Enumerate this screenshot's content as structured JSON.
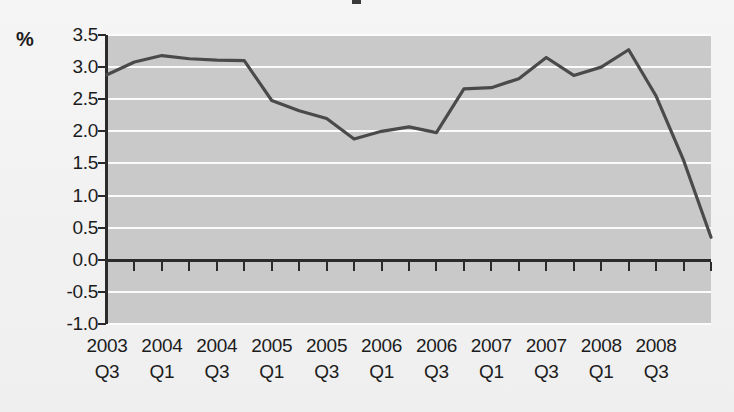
{
  "figure": {
    "axis_unit_label": "%",
    "background_color": "#c9c9c9",
    "page_color": "#f3f3f3",
    "gridline_color": "#fbfbfb",
    "axis_color": "#2b2b2b",
    "series_color": "#4a4a4a"
  },
  "chart_data": {
    "type": "line",
    "title": "",
    "subtitle": "",
    "xlabel": "",
    "ylabel": "%",
    "ylim": [
      -1.0,
      3.5
    ],
    "ytick_labels": [
      "3.5",
      "3.0",
      "2.5",
      "2.0",
      "1.5",
      "1.0",
      "0.5",
      "0.0",
      "-0.5",
      "-1.0"
    ],
    "ytick_values": [
      3.5,
      3.0,
      2.5,
      2.0,
      1.5,
      1.0,
      0.5,
      0.0,
      -0.5,
      -1.0
    ],
    "grid": true,
    "grid_axis": "y",
    "legend": "none",
    "x": [
      "2003 Q3",
      "2003 Q4",
      "2004 Q1",
      "2004 Q2",
      "2004 Q3",
      "2004 Q4",
      "2005 Q1",
      "2005 Q2",
      "2005 Q3",
      "2005 Q4",
      "2006 Q1",
      "2006 Q2",
      "2006 Q3",
      "2006 Q4",
      "2007 Q1",
      "2007 Q2",
      "2007 Q3",
      "2007 Q4",
      "2008 Q1",
      "2008 Q2",
      "2008 Q3",
      "2008 Q4",
      "2009 Q1"
    ],
    "xtick_labels": [
      {
        "index": 0,
        "year": "2003",
        "quarter": "Q3"
      },
      {
        "index": 2,
        "year": "2004",
        "quarter": "Q1"
      },
      {
        "index": 4,
        "year": "2004",
        "quarter": "Q3"
      },
      {
        "index": 6,
        "year": "2005",
        "quarter": "Q1"
      },
      {
        "index": 8,
        "year": "2005",
        "quarter": "Q3"
      },
      {
        "index": 10,
        "year": "2006",
        "quarter": "Q1"
      },
      {
        "index": 12,
        "year": "2006",
        "quarter": "Q3"
      },
      {
        "index": 14,
        "year": "2007",
        "quarter": "Q1"
      },
      {
        "index": 16,
        "year": "2007",
        "quarter": "Q3"
      },
      {
        "index": 18,
        "year": "2008",
        "quarter": "Q1"
      },
      {
        "index": 20,
        "year": "2008",
        "quarter": "Q3"
      }
    ],
    "series": [
      {
        "name": "",
        "values": [
          2.88,
          3.08,
          3.18,
          3.13,
          3.11,
          3.1,
          2.48,
          2.32,
          2.2,
          1.88,
          2.0,
          2.07,
          1.98,
          2.66,
          2.68,
          2.82,
          3.15,
          2.87,
          3.0,
          3.27,
          2.55,
          1.55,
          0.35
        ]
      }
    ]
  }
}
